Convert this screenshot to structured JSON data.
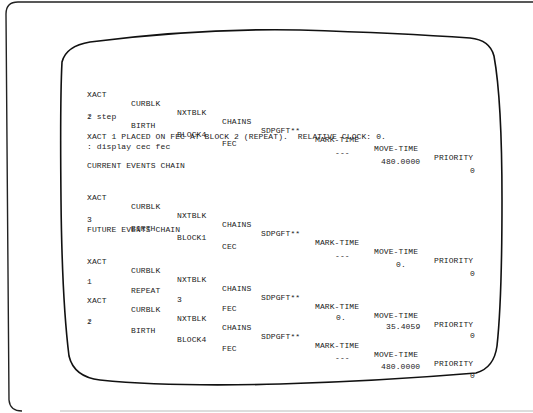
{
  "terminal": {
    "columns": [
      "XACT",
      "CURBLK",
      "NXTBLK",
      "CHAINS",
      "SDPGFT**",
      "MARK-TIME",
      "MOVE-TIME",
      "PRIORITY"
    ],
    "first_block": {
      "row": {
        "xact": "2",
        "curblk": "BIRTH",
        "nxtblk": "BLOCK4",
        "chains": "FEC",
        "sdpgft": "",
        "mark_time": "---",
        "move_time": "480.0000",
        "priority": "0"
      }
    },
    "command_step": ": step",
    "message": "XACT 1 PLACED ON FEC AT BLOCK 2 (REPEAT).  RELATIVE CLOCK: 0.",
    "command_display": ": display cec fec",
    "cec": {
      "title": "CURRENT EVENTS CHAIN",
      "rows": [
        {
          "xact": "3",
          "curblk": "BIRTH",
          "nxtblk": "BLOCK1",
          "chains": "CEC",
          "sdpgft": "",
          "mark_time": "---",
          "move_time": "0.",
          "priority": "0"
        }
      ]
    },
    "fec": {
      "title": "FUTURE EVENTS CHAIN",
      "rows": [
        {
          "xact": "1",
          "curblk": "REPEAT",
          "nxtblk": "3",
          "chains": "FEC",
          "sdpgft": "",
          "mark_time": "0.",
          "move_time": "35.4059",
          "priority": "0"
        },
        {
          "xact": "2",
          "curblk": "BIRTH",
          "nxtblk": "BLOCK4",
          "chains": "FEC",
          "sdpgft": "",
          "mark_time": "---",
          "move_time": "480.0000",
          "priority": "0"
        }
      ]
    },
    "prompt": ":"
  }
}
